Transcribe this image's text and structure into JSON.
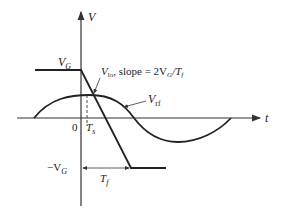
{
  "diagram": {
    "type": "waveform",
    "axes": {
      "y_label": "V",
      "x_label": "t",
      "origin_label": "0"
    },
    "labels": {
      "vg_pos": "V",
      "vg_pos_sub": "G",
      "vg_neg_prefix": "−V",
      "vg_neg_sub": "G",
      "vlo": "V",
      "vlo_sub": "lo",
      "slope_text": ", slope = 2V",
      "slope_sub_g": "G",
      "slope_div": "/T",
      "slope_sub_f": "f",
      "vrf": "V",
      "vrf_sub": "rf",
      "ts": "T",
      "ts_sub": "s",
      "tf": "T",
      "tf_sub": "f"
    },
    "colors": {
      "line": "#222222",
      "axis": "#333333"
    }
  }
}
